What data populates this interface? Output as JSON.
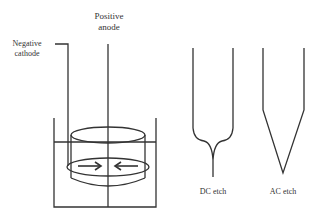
{
  "labels": {
    "anode_line1": "Positive",
    "anode_line2": "anode",
    "cathode_line1": "Negative",
    "cathode_line2": "cathode",
    "dc_etch": "DC etch",
    "ac_etch": "AC etch"
  },
  "colors": {
    "stroke": "#333333",
    "background": "#ffffff"
  }
}
